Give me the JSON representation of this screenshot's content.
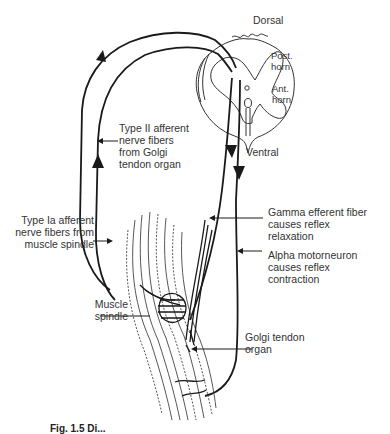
{
  "figure": {
    "spinal_cord_labels": {
      "dorsal": "Dorsal",
      "post_horn": "Post.\nhorn",
      "ant_horn": "Ant.\nhorn",
      "ventral": "Ventral"
    },
    "labels": {
      "type2_afferent": "Type II afferent\nnerve fibers\nfrom Golgi\ntendon organ",
      "type1a_afferent": "Type Ia afferent\nnerve fibers from\nmuscle spindle",
      "gamma_efferent": "Gamma efferent fiber\ncauses reflex\nrelaxation",
      "alpha_motor": "Alpha motorneuron\ncauses reflex\ncontraction",
      "muscle_spindle": "Muscle\nspindle",
      "golgi_tendon": "Golgi tendon\norgan"
    },
    "caption": "Fig. 1.5 Di..."
  },
  "colors": {
    "line": "#1a1a1a",
    "text": "#333333",
    "background": "#ffffff"
  }
}
